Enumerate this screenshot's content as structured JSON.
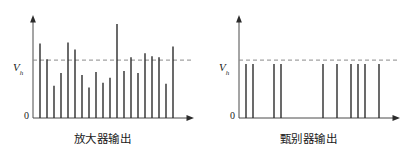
{
  "figure": {
    "background": "#ffffff",
    "pulse_color": "#2b2b2b",
    "axis_color": "#4a4a4a",
    "threshold_color": "#8a8a8a"
  },
  "panels": [
    {
      "id": "amplifier-output",
      "caption": "放大器输出",
      "y_axis_label": "V",
      "y_axis_subscript": "h",
      "origin_label": "0",
      "threshold_value": 55,
      "chart_data": {
        "type": "bar",
        "title": "放大器输出",
        "xlabel": "",
        "ylabel": "V",
        "ylim": [
          0,
          100
        ],
        "grid": false,
        "legend": null,
        "annotations": [
          "threshold dashed line at V = 55"
        ],
        "categories": [
          "1",
          "2",
          "3",
          "4",
          "5",
          "6",
          "7",
          "8",
          "9",
          "10",
          "11",
          "12",
          "13",
          "14",
          "15",
          "16",
          "17",
          "18",
          "19",
          "20",
          "21"
        ],
        "values": [
          76,
          60,
          33,
          46,
          77,
          70,
          44,
          31,
          47,
          36,
          41,
          96,
          48,
          62,
          46,
          66,
          63,
          62,
          35,
          73,
          0
        ]
      }
    },
    {
      "id": "discriminator-output",
      "caption": "甄别器输出",
      "y_axis_label": "V",
      "y_axis_subscript": "h",
      "origin_label": "0",
      "threshold_value": 55,
      "chart_data": {
        "type": "bar",
        "title": "甄别器输出",
        "xlabel": "",
        "ylabel": "V",
        "ylim": [
          0,
          100
        ],
        "grid": false,
        "legend": null,
        "annotations": [
          "all surviving pulses standardized to V = 55"
        ],
        "categories": [
          "1",
          "2",
          "5",
          "6",
          "12",
          "14",
          "16",
          "17",
          "18",
          "20"
        ],
        "values": [
          55,
          55,
          55,
          55,
          55,
          55,
          55,
          55,
          55,
          55
        ]
      }
    }
  ]
}
